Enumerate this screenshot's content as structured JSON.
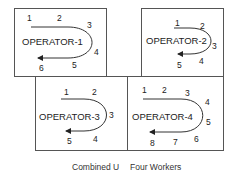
{
  "caption": {
    "left": "Combined U",
    "right": "Four Workers"
  },
  "operators": [
    {
      "label": "OPERATOR-1",
      "stations": [
        "1",
        "2",
        "3",
        "4",
        "5",
        "6"
      ]
    },
    {
      "label": "OPERATOR-2",
      "stations": [
        "1",
        "2",
        "3",
        "4",
        "5"
      ]
    },
    {
      "label": "OPERATOR-3",
      "stations": [
        "1",
        "2",
        "3",
        "4",
        "5"
      ]
    },
    {
      "label": "OPERATOR-4",
      "stations": [
        "1",
        "2",
        "3",
        "4",
        "5",
        "6",
        "7",
        "8"
      ]
    }
  ]
}
